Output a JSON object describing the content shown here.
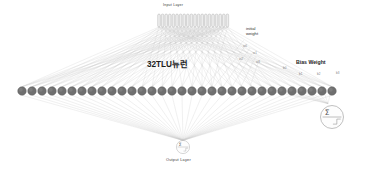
{
  "diagram": {
    "title_hidden_layer": "32TLU뉴런",
    "input_layer_label": "Input Layer",
    "output_layer_label": "Output Layer",
    "initial_weight_label_line1": "initial",
    "initial_weight_label_line2": "weight",
    "bias_weight_label": "Bias Weight",
    "colors": {
      "background": "#ffffff",
      "neuron_fill": "#6f6f6f",
      "neuron_stroke": "#5a5a5a",
      "edge": "#c9c9c9",
      "input_node_fill": "#ededed",
      "input_node_stroke": "#9a9a9a",
      "text": "#2b2b2b",
      "faint_text": "#8a8a8a"
    }
  },
  "input_layer": {
    "count": 20,
    "shape": "capsule",
    "x_start": 159,
    "x_step": 3.6,
    "y_top": 14,
    "node_width": 2.6,
    "node_height": 13
  },
  "hidden_layer": {
    "label": "32TLU뉴런",
    "count": 32,
    "x_start": 22,
    "x_step": 10.0,
    "y": 91,
    "radius": 4.3
  },
  "output_layer": {
    "label": "Output Layer",
    "cx": 183,
    "cy": 147,
    "radius": 6.6,
    "symbol_top": "Σ",
    "symbol_bottom": "step"
  },
  "bias_detail_node": {
    "cx": 332,
    "cy": 117,
    "radius": 11.5,
    "symbol_top": "Σ",
    "symbol_bottom": "step"
  },
  "weight_labels": [
    {
      "text": "w0",
      "x": 243,
      "y": 44
    },
    {
      "text": "w1",
      "x": 253,
      "y": 51
    },
    {
      "text": "w2",
      "x": 239,
      "y": 57
    },
    {
      "text": "w3",
      "x": 256,
      "y": 60
    }
  ],
  "bias_labels": [
    {
      "text": "b0",
      "x": 283,
      "y": 66
    },
    {
      "text": "b1",
      "x": 299,
      "y": 72
    },
    {
      "text": "b2",
      "x": 317,
      "y": 72
    },
    {
      "text": "b3",
      "x": 336,
      "y": 71
    }
  ]
}
